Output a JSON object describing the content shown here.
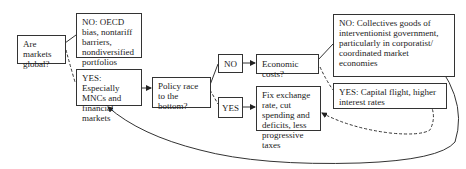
{
  "diagram": {
    "nodes": {
      "q_global": {
        "label": "Are markets global?"
      },
      "no_global": {
        "label": "NO: OECD bias, nontariff barriers, nondiversified portfolios"
      },
      "yes_global": {
        "label": "YES: Especially MNCs and financial markets"
      },
      "q_race": {
        "label": "Policy race to the bottom?"
      },
      "no_race": {
        "label": "NO"
      },
      "yes_race": {
        "label": "YES"
      },
      "q_costs": {
        "label": "Economic costs?"
      },
      "fix_policy": {
        "label": "Fix exchange rate, cut spending and deficits, less progressive taxes"
      },
      "no_costs": {
        "label": "NO: Collectives goods of interventionist government, particularly in corporatist/ coordinated market economies"
      },
      "yes_costs": {
        "label": "YES: Capital flight, higher interest rates"
      }
    },
    "edges": [
      {
        "from": "q_global",
        "to": "no_global",
        "style": "solid"
      },
      {
        "from": "q_global",
        "to": "yes_global",
        "style": "dashed"
      },
      {
        "from": "yes_global",
        "to": "q_race",
        "style": "solid-arrow"
      },
      {
        "from": "q_race",
        "to": "no_race",
        "style": "solid"
      },
      {
        "from": "q_race",
        "to": "yes_race",
        "style": "dashed"
      },
      {
        "from": "no_race",
        "to": "q_costs",
        "style": "solid-arrow"
      },
      {
        "from": "yes_race",
        "to": "fix_policy",
        "style": "solid-arrow"
      },
      {
        "from": "q_costs",
        "to": "no_costs",
        "style": "solid"
      },
      {
        "from": "q_costs",
        "to": "yes_costs",
        "style": "dashed"
      },
      {
        "from": "yes_costs",
        "to": "fix_policy",
        "style": "dashed-arrow"
      },
      {
        "from": "no_costs",
        "to": "yes_global",
        "style": "solid-arrow"
      }
    ]
  }
}
